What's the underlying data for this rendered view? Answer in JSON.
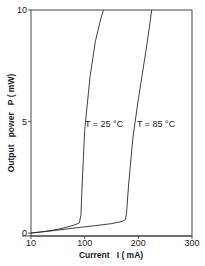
{
  "chart_data": {
    "type": "line",
    "title": "",
    "xlabel": "Current   I ( mA)",
    "ylabel": "Output   power   P ( mW)",
    "xlim": [
      0,
      300
    ],
    "ylim": [
      0,
      10
    ],
    "x_ticks": [
      0,
      100,
      200,
      300
    ],
    "x_tick_labels": [
      "10",
      "100",
      "200",
      "300"
    ],
    "y_ticks": [
      0,
      5,
      10
    ],
    "y_tick_labels": [
      "0",
      "5",
      "10"
    ],
    "grid": false,
    "legend": "none (inline curve labels)",
    "series": [
      {
        "name": "T = 25 °C",
        "label": "T = 25 °C",
        "threshold_mA": 93,
        "x": [
          0,
          20,
          40,
          60,
          80,
          90,
          93,
          95,
          100,
          110,
          120,
          130,
          135
        ],
        "y": [
          0,
          0.05,
          0.12,
          0.22,
          0.35,
          0.45,
          0.8,
          2.0,
          4.6,
          7.0,
          8.6,
          9.6,
          10
        ]
      },
      {
        "name": "T = 85 °C",
        "label": "T = 85 °C",
        "threshold_mA": 178,
        "x": [
          0,
          40,
          80,
          120,
          150,
          170,
          176,
          178,
          182,
          190,
          200,
          215,
          225
        ],
        "y": [
          0,
          0.1,
          0.22,
          0.33,
          0.42,
          0.52,
          0.6,
          0.9,
          2.2,
          4.3,
          6.0,
          8.3,
          10
        ]
      }
    ],
    "annotations": [
      {
        "text": "T = 25 °C",
        "near_series": "T = 25 °C",
        "x": 102,
        "y": 5
      },
      {
        "text": "T = 85 °C",
        "near_series": "T = 85 °C",
        "x": 188,
        "y": 5
      }
    ]
  },
  "axes": {
    "x_title": "Current   I ( mA)",
    "y_title": "Output   power   P ( mW)",
    "x_ticks": [
      "10",
      "100",
      "200",
      "300"
    ],
    "y_ticks": [
      "0",
      "5",
      "10"
    ]
  },
  "labels": {
    "t25": "T = 25 °C",
    "t85": "T = 85 °C"
  },
  "colors": {
    "line": "#2a2a2a",
    "axis": "#333333",
    "background": "#ffffff"
  }
}
